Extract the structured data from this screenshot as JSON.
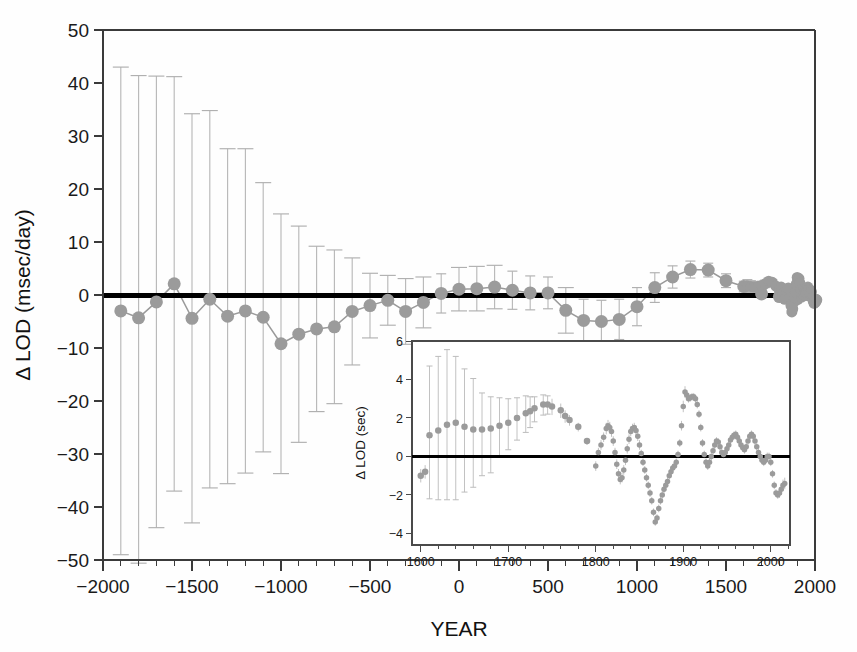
{
  "figure": {
    "kind": "scientific-figure",
    "background_color": "#fefefe",
    "point_color": "#9b9b9b",
    "errorbar_color": "#b9b9b9",
    "axis_color": "#3a3a3a",
    "zero_line_color": "#000000"
  },
  "chart_data": [
    {
      "id": "main",
      "type": "scatter",
      "title": "",
      "xlabel": "YEAR",
      "ylabel": "Δ LOD (msec/day)",
      "xlim": [
        -2000,
        2000
      ],
      "ylim": [
        -50,
        50
      ],
      "grid": false,
      "legend": null,
      "xticks": [
        -2000,
        -1500,
        -1000,
        -500,
        0,
        500,
        1000,
        1500,
        2000
      ],
      "xtick_labels": [
        "-2000",
        "-1500",
        "-1000",
        "-500",
        "0",
        "500",
        "1000",
        "1500",
        "2000"
      ],
      "xminor_step": 100,
      "yticks": [
        -50,
        -40,
        -30,
        -20,
        -10,
        0,
        10,
        20,
        30,
        40,
        50
      ],
      "ytick_labels": [
        "-50",
        "-40",
        "-30",
        "-20",
        "-10",
        "0",
        "10",
        "20",
        "30",
        "40",
        "50"
      ],
      "zero_reference_y": 0,
      "series": [
        {
          "name": "Delta LOD with uncertainty",
          "marker": "filled-circle",
          "marker_size": 13,
          "connected": true,
          "x": [
            -1900,
            -1800,
            -1700,
            -1600,
            -1500,
            -1400,
            -1300,
            -1200,
            -1100,
            -1000,
            -900,
            -800,
            -700,
            -600,
            -500,
            -400,
            -300,
            -200,
            -100,
            0,
            100,
            200,
            300,
            400,
            500,
            600,
            700,
            800,
            900,
            1000,
            1100,
            1200,
            1300,
            1400,
            1500,
            1600,
            1700,
            1800,
            1900,
            2000
          ],
          "y": [
            -3.0,
            -4.3,
            -1.3,
            2.1,
            -4.4,
            -0.8,
            -4.0,
            -3.0,
            -4.2,
            -9.2,
            -7.4,
            -6.4,
            -6.0,
            -3.1,
            -2.0,
            -1.0,
            -3.1,
            -1.4,
            0.3,
            1.1,
            1.2,
            1.5,
            0.9,
            0.4,
            0.4,
            -2.9,
            -4.8,
            -5.0,
            -4.6,
            -2.2,
            1.4,
            3.4,
            4.8,
            4.7,
            2.7,
            1.6,
            0.2,
            -0.3,
            -0.7,
            -1.2
          ],
          "yerr_upper": [
            46.0,
            45.7,
            42.6,
            39.1,
            38.6,
            35.6,
            31.6,
            30.6,
            25.4,
            24.5,
            20.4,
            15.6,
            14.5,
            10.1,
            6.1,
            4.7,
            6.2,
            4.8,
            3.7,
            4.1,
            4.2,
            4.1,
            3.6,
            3.2,
            3.0,
            4.3,
            4.0,
            4.0,
            3.8,
            3.6,
            2.8,
            2.1,
            1.6,
            1.3,
            1.3,
            1.0,
            0.7,
            0.6,
            0.6,
            0.6
          ],
          "yerr_lower": [
            46.0,
            46.3,
            42.6,
            39.1,
            38.6,
            35.6,
            31.6,
            30.6,
            25.4,
            24.5,
            20.4,
            15.6,
            14.5,
            10.1,
            6.1,
            4.7,
            6.2,
            4.8,
            3.7,
            4.1,
            4.2,
            4.1,
            3.6,
            3.2,
            3.0,
            4.3,
            4.0,
            4.0,
            3.8,
            3.6,
            2.8,
            2.1,
            1.6,
            1.3,
            1.3,
            1.0,
            0.7,
            0.6,
            0.6,
            0.6
          ]
        },
        {
          "name": "Modern dense record",
          "marker": "filled-circle",
          "marker_size": 11,
          "connected": false,
          "x": [
            1620,
            1640,
            1660,
            1680,
            1700,
            1720,
            1740,
            1760,
            1780,
            1800,
            1810,
            1820,
            1830,
            1840,
            1850,
            1860,
            1865,
            1870,
            1875,
            1880,
            1885,
            1890,
            1895,
            1900,
            1905,
            1910,
            1915,
            1920,
            1925,
            1930,
            1935,
            1940,
            1945,
            1950,
            1955,
            1960,
            1965,
            1970,
            1975,
            1980,
            1985,
            1990,
            1995,
            2000,
            2005,
            2010
          ],
          "y": [
            1.7,
            1.6,
            1.5,
            1.6,
            1.8,
            2.1,
            2.6,
            2.4,
            1.7,
            0.9,
            1.5,
            0.3,
            -0.8,
            0.9,
            1.3,
            -0.6,
            -2.0,
            -3.2,
            -2.6,
            -1.4,
            -0.5,
            0.6,
            2.1,
            3.3,
            3.0,
            3.1,
            2.3,
            0.9,
            -0.4,
            0.2,
            0.9,
            0.5,
            -0.1,
            0.4,
            1.1,
            1.5,
            1.0,
            0.3,
            0.9,
            0.6,
            -0.5,
            -1.2,
            -1.6,
            -1.1,
            -0.8,
            -0.9
          ],
          "yerr_upper": [
            1.2,
            1.1,
            1.0,
            0.9,
            0.8,
            0.7,
            0.6,
            0.5,
            0.4,
            0.35,
            0.3,
            0.3,
            0.3,
            0.3,
            0.3,
            0.3,
            0.3,
            0.3,
            0.25,
            0.25,
            0.25,
            0.25,
            0.2,
            0.2,
            0.2,
            0.2,
            0.2,
            0.2,
            0.2,
            0.2,
            0.2,
            0.2,
            0.15,
            0.15,
            0.15,
            0.15,
            0.15,
            0.15,
            0.15,
            0.15,
            0.12,
            0.12,
            0.12,
            0.12,
            0.1,
            0.1
          ],
          "yerr_lower": [
            1.2,
            1.1,
            1.0,
            0.9,
            0.8,
            0.7,
            0.6,
            0.5,
            0.4,
            0.35,
            0.3,
            0.3,
            0.3,
            0.3,
            0.3,
            0.3,
            0.3,
            0.3,
            0.25,
            0.25,
            0.25,
            0.25,
            0.2,
            0.2,
            0.2,
            0.2,
            0.2,
            0.2,
            0.2,
            0.2,
            0.2,
            0.2,
            0.15,
            0.15,
            0.15,
            0.15,
            0.15,
            0.15,
            0.15,
            0.15,
            0.12,
            0.12,
            0.12,
            0.12,
            0.1,
            0.1
          ]
        }
      ]
    },
    {
      "id": "inset",
      "type": "scatter",
      "title": "",
      "xlabel": "",
      "ylabel": "Δ LOD (sec)",
      "xlim": [
        1590,
        2022
      ],
      "ylim": [
        -4.6,
        6
      ],
      "grid": false,
      "legend": null,
      "xticks": [
        1600,
        1700,
        1800,
        1900,
        2000
      ],
      "xtick_labels": [
        "1600",
        "1700",
        "1800",
        "1900",
        "2000"
      ],
      "xminor_step": 20,
      "yticks": [
        -4,
        -2,
        0,
        2,
        4,
        6
      ],
      "ytick_labels": [
        "-4",
        "-2",
        "0",
        "2",
        "4",
        "6"
      ],
      "zero_reference_y": 0,
      "series": [
        {
          "name": "Historical eclipse solutions",
          "marker": "filled-circle",
          "marker_size": 6.5,
          "connected": false,
          "x": [
            1600,
            1605,
            1610,
            1620,
            1630,
            1640,
            1650,
            1660,
            1670,
            1680,
            1690,
            1700,
            1710,
            1720,
            1725,
            1730,
            1740,
            1745,
            1750,
            1760,
            1765,
            1770,
            1780,
            1790
          ],
          "y": [
            -1.0,
            -0.8,
            1.1,
            1.35,
            1.65,
            1.75,
            1.55,
            1.4,
            1.4,
            1.45,
            1.6,
            1.75,
            2.0,
            2.25,
            2.35,
            2.5,
            2.7,
            2.7,
            2.6,
            2.4,
            2.1,
            1.9,
            1.55,
            0.8
          ],
          "yerr_upper": [
            0.35,
            0.35,
            3.6,
            3.85,
            3.9,
            3.45,
            3.0,
            2.65,
            1.9,
            1.65,
            1.45,
            1.25,
            1.05,
            0.9,
            0.75,
            0.6,
            0.5,
            0.45,
            0.4,
            0.35,
            0.3,
            0.25,
            0.2,
            0.15
          ],
          "yerr_lower": [
            0.35,
            0.35,
            3.3,
            3.6,
            3.9,
            4.0,
            3.4,
            3.0,
            2.4,
            2.3,
            1.6,
            1.4,
            1.15,
            1.0,
            0.85,
            0.7,
            0.55,
            0.5,
            0.45,
            0.4,
            0.35,
            0.3,
            0.25,
            0.2
          ]
        },
        {
          "name": "Telescopic / modern record",
          "marker": "filled-circle",
          "marker_size": 5.5,
          "connected": false,
          "x": [
            1800,
            1803,
            1806,
            1809,
            1812,
            1814,
            1816,
            1818,
            1820,
            1822,
            1824,
            1826,
            1828,
            1830,
            1832,
            1834,
            1836,
            1838,
            1840,
            1842,
            1844,
            1846,
            1848,
            1850,
            1852,
            1854,
            1856,
            1858,
            1860,
            1862,
            1864,
            1866,
            1868,
            1870,
            1872,
            1874,
            1876,
            1878,
            1880,
            1882,
            1884,
            1886,
            1888,
            1890,
            1892,
            1894,
            1896,
            1898,
            1900,
            1902,
            1904,
            1906,
            1908,
            1910,
            1912,
            1914,
            1916,
            1918,
            1920,
            1922,
            1924,
            1926,
            1928,
            1930,
            1932,
            1934,
            1936,
            1938,
            1940,
            1942,
            1944,
            1946,
            1948,
            1950,
            1952,
            1954,
            1956,
            1958,
            1960,
            1962,
            1964,
            1966,
            1968,
            1970,
            1972,
            1974,
            1976,
            1978,
            1980,
            1982,
            1984,
            1986,
            1988,
            1990,
            1992,
            1994,
            1996,
            1998,
            2000,
            2002,
            2004,
            2006,
            2008,
            2010,
            2012,
            2014,
            2016
          ],
          "y": [
            -0.5,
            0.2,
            0.6,
            1.0,
            1.45,
            1.6,
            1.5,
            1.3,
            0.8,
            0.2,
            -0.4,
            -0.9,
            -1.2,
            -1.1,
            -0.7,
            -0.2,
            0.4,
            0.9,
            1.3,
            1.45,
            1.5,
            1.35,
            1.05,
            0.6,
            0.15,
            -0.3,
            -0.7,
            -1.1,
            -1.5,
            -1.9,
            -2.3,
            -2.9,
            -3.4,
            -3.2,
            -2.7,
            -2.3,
            -2.0,
            -1.7,
            -1.5,
            -1.3,
            -1.0,
            -0.8,
            -0.6,
            -0.5,
            -0.3,
            0.1,
            0.7,
            1.6,
            2.6,
            3.35,
            3.2,
            3.0,
            3.05,
            3.1,
            3.1,
            3.0,
            2.7,
            2.2,
            1.5,
            0.7,
            0.1,
            -0.3,
            -0.5,
            -0.3,
            0.0,
            0.3,
            0.6,
            0.8,
            0.75,
            0.5,
            0.2,
            0.1,
            0.2,
            0.4,
            0.6,
            0.85,
            1.0,
            1.1,
            1.15,
            1.0,
            0.8,
            0.6,
            0.45,
            0.35,
            0.5,
            0.8,
            1.05,
            1.15,
            1.05,
            0.8,
            0.5,
            0.2,
            0.0,
            -0.2,
            -0.3,
            -0.2,
            0.0,
            0.0,
            -0.3,
            -0.9,
            -1.5,
            -1.9,
            -2.0,
            -1.9,
            -1.7,
            -1.5,
            -1.4
          ],
          "yerr_upper": [
            0.25,
            0.25,
            0.25,
            0.25,
            0.3,
            0.3,
            0.3,
            0.28,
            0.25,
            0.25,
            0.25,
            0.25,
            0.25,
            0.25,
            0.25,
            0.25,
            0.25,
            0.25,
            0.25,
            0.25,
            0.25,
            0.25,
            0.25,
            0.25,
            0.2,
            0.2,
            0.2,
            0.2,
            0.2,
            0.2,
            0.2,
            0.2,
            0.2,
            0.2,
            0.2,
            0.2,
            0.2,
            0.2,
            0.2,
            0.2,
            0.2,
            0.2,
            0.2,
            0.2,
            0.2,
            0.2,
            0.2,
            0.25,
            0.3,
            0.3,
            0.25,
            0.2,
            0.2,
            0.2,
            0.2,
            0.2,
            0.2,
            0.2,
            0.2,
            0.2,
            0.2,
            0.2,
            0.2,
            0.2,
            0.2,
            0.2,
            0.2,
            0.2,
            0.2,
            0.2,
            0.2,
            0.2,
            0.2,
            0.2,
            0.2,
            0.2,
            0.2,
            0.2,
            0.2,
            0.2,
            0.2,
            0.2,
            0.2,
            0.2,
            0.2,
            0.2,
            0.2,
            0.2,
            0.2,
            0.2,
            0.2,
            0.2,
            0.2,
            0.2,
            0.2,
            0.2,
            0.2,
            0.2,
            0.2,
            0.2,
            0.2,
            0.2,
            0.2,
            0.25,
            0.3,
            0.3,
            0.3
          ],
          "yerr_lower": [
            0.25,
            0.25,
            0.25,
            0.25,
            0.3,
            0.3,
            0.3,
            0.28,
            0.25,
            0.25,
            0.25,
            0.25,
            0.25,
            0.25,
            0.25,
            0.25,
            0.25,
            0.25,
            0.25,
            0.25,
            0.25,
            0.25,
            0.25,
            0.25,
            0.2,
            0.2,
            0.2,
            0.2,
            0.2,
            0.2,
            0.2,
            0.2,
            0.2,
            0.2,
            0.2,
            0.2,
            0.2,
            0.2,
            0.2,
            0.2,
            0.2,
            0.2,
            0.2,
            0.2,
            0.2,
            0.2,
            0.2,
            0.25,
            0.3,
            0.3,
            0.25,
            0.2,
            0.2,
            0.2,
            0.2,
            0.2,
            0.2,
            0.2,
            0.2,
            0.2,
            0.2,
            0.2,
            0.2,
            0.2,
            0.2,
            0.2,
            0.2,
            0.2,
            0.2,
            0.2,
            0.2,
            0.2,
            0.2,
            0.2,
            0.2,
            0.2,
            0.2,
            0.2,
            0.2,
            0.2,
            0.2,
            0.2,
            0.2,
            0.2,
            0.2,
            0.2,
            0.2,
            0.2,
            0.2,
            0.2,
            0.2,
            0.2,
            0.2,
            0.2,
            0.2,
            0.2,
            0.2,
            0.2,
            0.2,
            0.2,
            0.2,
            0.2,
            0.2,
            0.25,
            0.3,
            0.3,
            0.3
          ]
        }
      ]
    }
  ],
  "geometry": {
    "main": {
      "left": 103,
      "right": 815,
      "top": 30,
      "bottom": 560
    },
    "inset": {
      "left": 412,
      "right": 790,
      "top": 341,
      "bottom": 545
    }
  }
}
